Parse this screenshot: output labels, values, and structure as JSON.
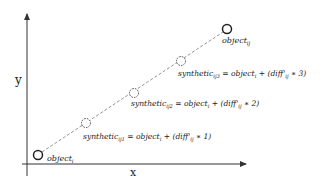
{
  "diagram": {
    "axes": {
      "x_label": "x",
      "y_label": "y",
      "color": "#333333"
    },
    "points": {
      "origin": {
        "name": "object",
        "sub": "i"
      },
      "target": {
        "name": "object",
        "sub": "ij"
      },
      "synthetic": [
        {
          "name": "synthetic",
          "sub": "ij1",
          "eq": "= object",
          "eq_sub": "i",
          "plus": "+ (diff'",
          "diff_sub": "ij",
          "mult": "∗ 1)"
        },
        {
          "name": "synthetic",
          "sub": "ij2",
          "eq": "= object",
          "eq_sub": "i",
          "plus": "+ (diff'",
          "diff_sub": "ij",
          "mult": "∗ 2)"
        },
        {
          "name": "synthetic",
          "sub": "ij3",
          "eq": "= object",
          "eq_sub": "i",
          "plus": "+ (diff'",
          "diff_sub": "ij",
          "mult": "∗ 3)"
        }
      ]
    },
    "line_style": "dashed",
    "colors": {
      "stroke": "#333333",
      "dashed": "#666666",
      "text": "#1a1a1a"
    }
  }
}
